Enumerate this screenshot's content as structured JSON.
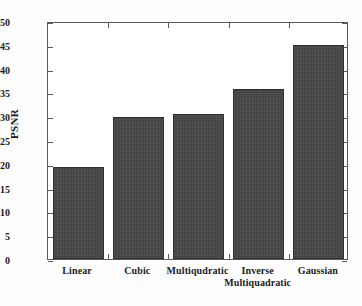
{
  "chart_data": {
    "type": "bar",
    "title": "",
    "xlabel": "",
    "ylabel": "PSNR",
    "categories": [
      "Linear",
      "Cubic",
      "Multiqudratic",
      "Inverse Multiquadratic",
      "Gaussian"
    ],
    "category_lines": [
      [
        "Linear"
      ],
      [
        "Cubic"
      ],
      [
        "Multiqudratic"
      ],
      [
        "Inverse",
        "Multiquadratic"
      ],
      [
        "Gaussian"
      ]
    ],
    "values": [
      19.4,
      29.8,
      30.4,
      35.8,
      45.0
    ],
    "ylim": [
      0,
      50
    ],
    "ytick_labels": [
      "0",
      "5",
      "10",
      "15",
      "20",
      "25",
      "30",
      "35",
      "40",
      "45",
      "50"
    ],
    "ytick_values": [
      0,
      5,
      10,
      15,
      20,
      25,
      30,
      35,
      40,
      45,
      50
    ],
    "grid": false,
    "legend": false,
    "bar_color": "#474747",
    "axis_color": "#5a5a5a",
    "background_color": "#ffffff"
  }
}
